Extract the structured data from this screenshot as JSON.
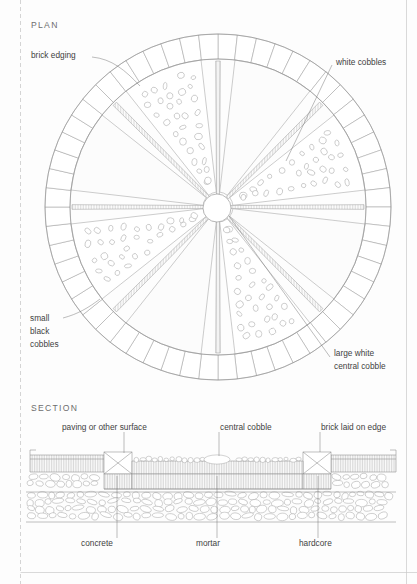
{
  "drawing": {
    "plan": {
      "title": "PLAN",
      "labels": [
        {
          "id": "brick-edging",
          "text": "brick edging",
          "lines": [
            "brick edging"
          ]
        },
        {
          "id": "white-cobbles",
          "text": "white cobbles",
          "lines": [
            "white cobbles"
          ]
        },
        {
          "id": "small-black-cobbles",
          "text": "small black cobbles",
          "lines": [
            "small",
            "black",
            "cobbles"
          ]
        },
        {
          "id": "large-white-central-cobble",
          "text": "large white central cobble",
          "lines": [
            "large white",
            "central cobble"
          ]
        }
      ]
    },
    "section": {
      "title": "SECTION",
      "labels": [
        {
          "id": "paving-or-other-surface",
          "text": "paving or other surface"
        },
        {
          "id": "central-cobble",
          "text": "central cobble"
        },
        {
          "id": "brick-laid-on-edge",
          "text": "brick laid on edge"
        },
        {
          "id": "concrete",
          "text": "concrete"
        },
        {
          "id": "mortar",
          "text": "mortar"
        },
        {
          "id": "hardcore",
          "text": "hardcore"
        }
      ]
    },
    "colors": {
      "paper": "#fdfdfd",
      "line": "#8d8d8d",
      "text": "#3f3f3f",
      "header_text": "#6d6d6d"
    },
    "geometry": {
      "plan_center_x": 218,
      "plan_center_y": 207,
      "plan_outer_radius": 173,
      "plan_brick_inner_radius": 148,
      "plan_central_cobble_radius": 14,
      "plan_brick_count": 56,
      "plan_star_points": 8
    }
  }
}
